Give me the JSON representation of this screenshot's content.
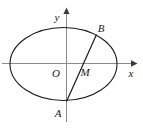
{
  "figure": {
    "kind": "geometry-diagram",
    "background_color": "#ffffff",
    "stroke_color": "#1a1a1a",
    "axis_color": "#8a8a8a",
    "canvas": {
      "width": 143,
      "height": 129
    }
  },
  "axes": {
    "x_axis": {
      "label": "x",
      "label_x": 131,
      "label_y": 72,
      "y": 63.5,
      "x_start": 2,
      "x_end": 134,
      "arrow": true
    },
    "y_axis": {
      "label": "y",
      "label_x": 58,
      "label_y": 17,
      "x": 66.5,
      "y_start": 122,
      "y_end": 10,
      "arrow": true
    },
    "origin": {
      "label": "O",
      "label_x": 54,
      "label_y": 76,
      "x": 66.5,
      "y": 63.5
    }
  },
  "ellipse": {
    "center_x": 63.5,
    "center_y": 64,
    "radius_x": 53.5,
    "radius_y": 36.5,
    "stroke_width": 1.1
  },
  "chord": {
    "name": "AB",
    "x1": 66.5,
    "y1": 101.5,
    "x2": 96.5,
    "y2": 34.5,
    "stroke_width": 1.2
  },
  "points": [
    {
      "id": "A",
      "label": "A",
      "x": 66.5,
      "y": 101.5,
      "label_x": 55,
      "label_y": 115
    },
    {
      "id": "B",
      "label": "B",
      "x": 96.5,
      "y": 34.5,
      "label_x": 99,
      "label_y": 30
    },
    {
      "id": "M",
      "label": "M",
      "x": 79,
      "y": 67,
      "label_x": 81,
      "label_y": 75
    }
  ]
}
